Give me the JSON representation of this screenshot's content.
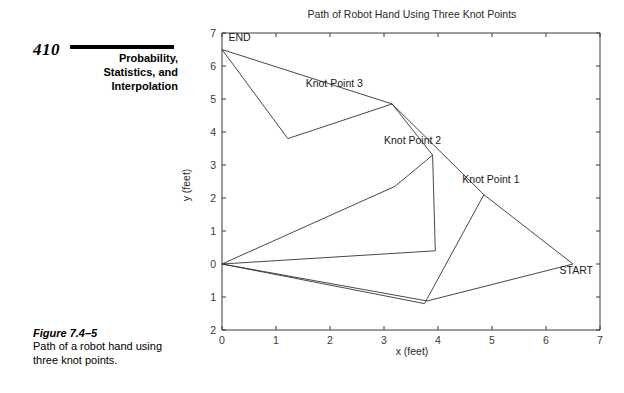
{
  "book": {
    "page_number": "410",
    "chapter_title_lines": [
      "Probability,",
      "Statistics, and",
      "Interpolation"
    ]
  },
  "figure_caption": {
    "label": "Figure 7.4–5",
    "line1": "Path of a robot hand using",
    "line2": "three knot points."
  },
  "chart_data": {
    "type": "line",
    "title": "Path of Robot Hand Using Three Knot Points",
    "xlabel": "x (feet)",
    "ylabel": "y (feet)",
    "xlim": [
      0,
      7
    ],
    "ylim": [
      -2,
      7
    ],
    "xticks": [
      0,
      1,
      2,
      3,
      4,
      5,
      6,
      7
    ],
    "xtick_labels": [
      "0",
      "1",
      "2",
      "3",
      "4",
      "5",
      "6",
      "7"
    ],
    "yticks": [
      -2,
      -1,
      0,
      1,
      2,
      3,
      4,
      5,
      6,
      7
    ],
    "ytick_labels": [
      "2",
      "1",
      "0",
      "1",
      "2",
      "3",
      "4",
      "5",
      "6",
      "7"
    ],
    "grid": false,
    "legend": "none",
    "annotations": [
      {
        "text": "END",
        "x": 0.12,
        "y": 6.75
      },
      {
        "text": "Knot Point 3",
        "x": 1.55,
        "y": 5.35
      },
      {
        "text": "Knot Point 2",
        "x": 3.0,
        "y": 3.65
      },
      {
        "text": "Knot Point 1",
        "x": 4.45,
        "y": 2.45
      },
      {
        "text": "START",
        "x": 6.25,
        "y": -0.3
      }
    ],
    "knot_points": [
      {
        "name": "START",
        "x": 6.5,
        "y": 0.0
      },
      {
        "name": "Knot Point 1",
        "x": 4.85,
        "y": 2.1
      },
      {
        "name": "Knot Point 2",
        "x": 3.9,
        "y": 3.3
      },
      {
        "name": "Knot Point 3",
        "x": 3.15,
        "y": 4.85
      },
      {
        "name": "END",
        "x": 0.0,
        "y": 6.5
      }
    ],
    "series": [
      {
        "name": "path-outer-upper",
        "points": [
          [
            0.0,
            6.5
          ],
          [
            3.15,
            4.85
          ],
          [
            4.85,
            2.1
          ],
          [
            6.5,
            0.0
          ]
        ]
      },
      {
        "name": "path-outer-lower",
        "points": [
          [
            6.5,
            0.0
          ],
          [
            3.8,
            -1.12
          ],
          [
            0.0,
            0.0
          ]
        ]
      },
      {
        "name": "path-inner-upper",
        "points": [
          [
            0.0,
            6.5
          ],
          [
            1.22,
            3.8
          ],
          [
            3.15,
            4.85
          ],
          [
            3.9,
            3.3
          ],
          [
            3.95,
            0.4
          ],
          [
            0.0,
            0.0
          ]
        ]
      },
      {
        "name": "path-inner-lower",
        "points": [
          [
            0.0,
            0.0
          ],
          [
            3.75,
            -1.2
          ],
          [
            4.85,
            2.1
          ]
        ]
      },
      {
        "name": "path-mid-link",
        "points": [
          [
            0.0,
            0.0
          ],
          [
            3.2,
            2.35
          ],
          [
            3.9,
            3.3
          ]
        ]
      }
    ]
  }
}
